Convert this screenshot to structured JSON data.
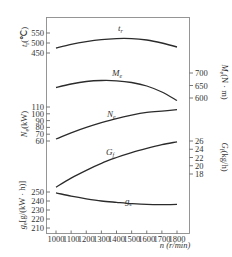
{
  "chart_data": {
    "type": "line",
    "title": "",
    "xlabel": "n (r/min)",
    "x": [
      1000,
      1100,
      1200,
      1300,
      1400,
      1500,
      1600,
      1700,
      1800
    ],
    "x_ticks": [
      "1000",
      "1100",
      "1200",
      "1300",
      "1400",
      "1500",
      "1600",
      "1700",
      "1800"
    ],
    "series": [
      {
        "name": "tr",
        "label": "t_r",
        "axis": "left",
        "ylabel": "t_r(℃)",
        "ticks": [
          450,
          500,
          550
        ],
        "values": [
          475,
          493,
          507,
          517,
          522,
          522,
          515,
          500,
          480
        ]
      },
      {
        "name": "Me",
        "label": "M_e",
        "axis": "right",
        "ylabel": "M_e(N·m)",
        "ticks": [
          600,
          650,
          700
        ],
        "values": [
          642,
          656,
          666,
          670,
          669,
          662,
          648,
          624,
          590
        ]
      },
      {
        "name": "Ne",
        "label": "N_e",
        "axis": "left",
        "ylabel": "N_e(kW)",
        "ticks": [
          60,
          70,
          80,
          90,
          100,
          110
        ],
        "values": [
          63,
          72,
          80,
          87,
          93,
          98,
          102,
          104,
          106
        ]
      },
      {
        "name": "Gf",
        "label": "G_f",
        "axis": "right",
        "ylabel": "G_f(kg/h)",
        "ticks": [
          18,
          20,
          22,
          24,
          26
        ],
        "values": [
          14.8,
          17.0,
          18.9,
          20.6,
          22.0,
          23.2,
          24.2,
          25.1,
          25.8
        ]
      },
      {
        "name": "ge",
        "label": "g_e",
        "axis": "left",
        "ylabel": "g_e[g/(kW·h)]",
        "ticks": [
          210,
          220,
          230,
          240,
          250
        ],
        "values": [
          249,
          245.5,
          242.5,
          240,
          238.5,
          237,
          236.2,
          236,
          236.2
        ]
      }
    ],
    "grid": false,
    "legend": "inline curve labels"
  },
  "labels": {
    "x_axis": "n (r/min)",
    "tr_axis": "t",
    "tr_axis_sub": "r",
    "tr_axis_unit": "(℃)",
    "me_axis": "M",
    "me_axis_sub": "e",
    "me_axis_unit": "(N · m)",
    "ne_axis": "N",
    "ne_axis_sub": "e",
    "ne_axis_unit": "(kW)",
    "gf_axis": "G",
    "gf_axis_sub": "f",
    "gf_axis_unit": "(kg/h)",
    "ge_axis": "g",
    "ge_axis_sub": "e",
    "ge_axis_unit": "[g/(kW · h)]",
    "tr_curve": "t",
    "tr_curve_sub": "r",
    "me_curve": "M",
    "me_curve_sub": "e",
    "ne_curve": "N",
    "ne_curve_sub": "e",
    "gf_curve": "G",
    "gf_curve_sub": "f",
    "ge_curve": "g",
    "ge_curve_sub": "e"
  }
}
